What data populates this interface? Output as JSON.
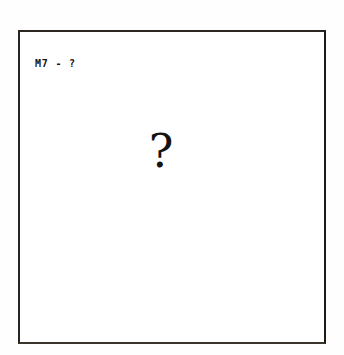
{
  "page": {
    "background_color": "#ffffff",
    "width": 344,
    "height": 355
  },
  "figure": {
    "border_color": "#231f18",
    "background_color": "#ffffff",
    "panel_label": "M7 - ?",
    "placeholder_symbol": "?",
    "placeholder_meaning": "unknown-content-placeholder"
  }
}
